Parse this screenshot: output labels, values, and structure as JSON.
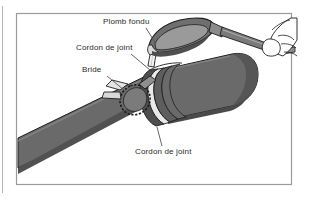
{
  "figure": {
    "title_caption": "",
    "frame": {
      "border_color": "#9a9a9a",
      "background": "#ffffff"
    },
    "palette": {
      "pipe_body": "#6a6a6a",
      "pipe_body_dark": "#565656",
      "pipe_shadow": "#4a4a4a",
      "collar_ring_dark": "#4e4e4e",
      "collar_gasket_light": "#e9e9e9",
      "ladle_fill": "#6f6f6f",
      "ladle_inner": "#8c8c8c",
      "handle_fill": "#7a7a7a",
      "hand_fill": "#ffffff",
      "molten_stream": "#f2f2f2",
      "outline": "#1e1e1e",
      "label_text": "#2b2b2b",
      "leader_line": "#555555"
    }
  },
  "labels": {
    "plomb_fondu": "Plomb fondu",
    "cordon_de_joint_haut": "Cordon de joint",
    "bride": "Bride",
    "cordon_de_joint_bas": "Cordon de joint"
  },
  "parts": {
    "pipe_left": "pipe-left-spigot",
    "pipe_right": "pipe-right-socket",
    "collar": "joint-collar",
    "clamp": "bride-clamp-ring",
    "ladle": "pouring-ladle",
    "hand": "operator-hand",
    "stream": "molten-lead-stream"
  }
}
